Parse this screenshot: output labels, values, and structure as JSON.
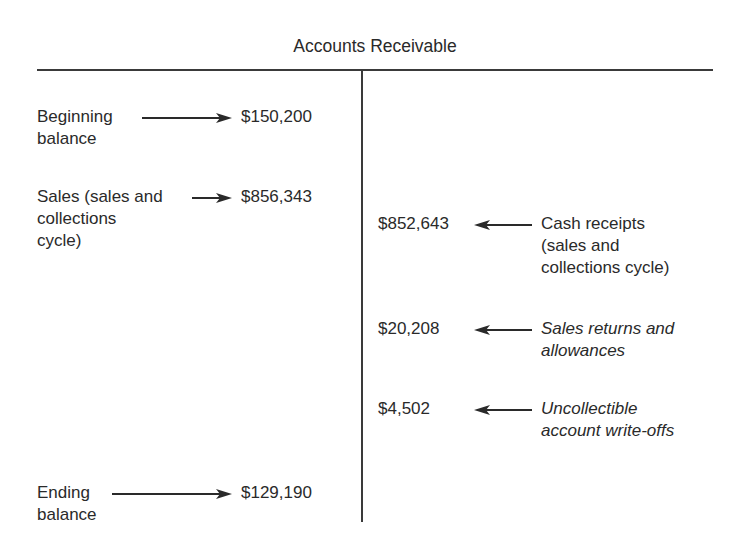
{
  "title": "Accounts Receivable",
  "debits": [
    {
      "label": "Beginning\nbalance",
      "amount": "$150,200"
    },
    {
      "label": "Sales (sales and\ncollections\ncycle)",
      "amount": "$856,343"
    },
    {
      "label": "Ending\nbalance",
      "amount": "$129,190"
    }
  ],
  "credits": [
    {
      "label": "Cash receipts\n(sales and\ncollections cycle)",
      "amount": "$852,643",
      "italic": false
    },
    {
      "label": "Sales returns and\nallowances",
      "amount": "$20,208",
      "italic": true
    },
    {
      "label": "Uncollectible\naccount write-offs",
      "amount": "$4,502",
      "italic": true
    }
  ],
  "colors": {
    "line": "#3a3a3a",
    "text": "#2a2a2a"
  }
}
